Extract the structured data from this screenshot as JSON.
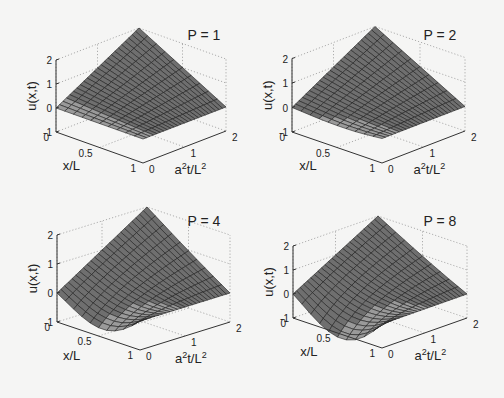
{
  "figure": {
    "background": "#f5f5f4",
    "surface_fill": "#6f6f6f",
    "surface_fill_light": "#9a9a9a",
    "mesh_color": "#1e1e1e",
    "axis_color": "#333333",
    "grid_color": "#9a9a9a"
  },
  "chart_data": [
    {
      "type": "surface",
      "title": "P = 1",
      "xlabel": "x/L",
      "ylabel": "a²t/L²",
      "zlabel": "u(x,t)",
      "x_ticks": [
        "0",
        "0.5",
        "1"
      ],
      "t_ticks": [
        "0",
        "1",
        "2"
      ],
      "z_ticks": [
        "-1",
        "0",
        "1",
        "2"
      ],
      "xlim": [
        0,
        1
      ],
      "tlim": [
        0,
        2
      ],
      "zlim": [
        -1,
        2
      ],
      "grid": true,
      "terms": 1,
      "dip": 0.0,
      "corner_values": {
        "x0_t0": 0,
        "x0_t2": 2,
        "x1_t0": 0,
        "x1_t2": 0
      },
      "min_value_approx": 0
    },
    {
      "type": "surface",
      "title": "P = 2",
      "xlabel": "x/L",
      "ylabel": "a²t/L²",
      "zlabel": "u(x,t)",
      "x_ticks": [
        "0",
        "0.5",
        "1"
      ],
      "t_ticks": [
        "0",
        "1",
        "2"
      ],
      "z_ticks": [
        "-1",
        "0",
        "1",
        "2"
      ],
      "xlim": [
        0,
        1
      ],
      "tlim": [
        0,
        2
      ],
      "zlim": [
        -1,
        2
      ],
      "grid": true,
      "terms": 2,
      "dip": 0.08,
      "corner_values": {
        "x0_t0": 0,
        "x0_t2": 2,
        "x1_t0": 0,
        "x1_t2": 0
      },
      "min_value_approx": -0.05
    },
    {
      "type": "surface",
      "title": "P = 4",
      "xlabel": "x/L",
      "ylabel": "a²t/L²",
      "zlabel": "u(x,t)",
      "x_ticks": [
        "0",
        "0.5",
        "1"
      ],
      "t_ticks": [
        "0",
        "1",
        "2"
      ],
      "z_ticks": [
        "-1",
        "0",
        "1",
        "2"
      ],
      "xlim": [
        0,
        1
      ],
      "tlim": [
        0,
        2
      ],
      "zlim": [
        -1,
        2
      ],
      "grid": true,
      "terms": 4,
      "dip": 0.55,
      "corner_values": {
        "x0_t0": 0,
        "x0_t2": 2,
        "x1_t0": 0,
        "x1_t2": 0
      },
      "min_value_approx": -0.5
    },
    {
      "type": "surface",
      "title": "P = 8",
      "xlabel": "x/L",
      "ylabel": "a²t/L²",
      "zlabel": "u(x,t)",
      "x_ticks": [
        "0",
        "0.5",
        "1"
      ],
      "t_ticks": [
        "0",
        "1",
        "2"
      ],
      "z_ticks": [
        "-1",
        "0",
        "1",
        "2"
      ],
      "xlim": [
        0,
        1
      ],
      "tlim": [
        0,
        2
      ],
      "zlim": [
        -1,
        2
      ],
      "grid": true,
      "terms": 8,
      "dip": 0.9,
      "corner_values": {
        "x0_t0": 0,
        "x0_t2": 2,
        "x1_t0": 0,
        "x1_t2": 0
      },
      "min_value_approx": -0.85
    }
  ],
  "panels": [
    {
      "origin": [
        56,
        132
      ],
      "front": [
        143,
        163
      ],
      "right": [
        226,
        131
      ],
      "u_px": 24,
      "title_pos": [
        204,
        40
      ]
    },
    {
      "origin": [
        292,
        132
      ],
      "front": [
        382,
        163
      ],
      "right": [
        465,
        131
      ],
      "u_px": 24.5,
      "title_pos": [
        440,
        40
      ]
    },
    {
      "origin": [
        57,
        322
      ],
      "front": [
        140,
        350
      ],
      "right": [
        230,
        322
      ],
      "u_px": 29,
      "title_pos": [
        204,
        226
      ]
    },
    {
      "origin": [
        293,
        318
      ],
      "front": [
        382,
        348
      ],
      "right": [
        467,
        318
      ],
      "u_px": 24,
      "title_pos": [
        440,
        226
      ]
    }
  ]
}
